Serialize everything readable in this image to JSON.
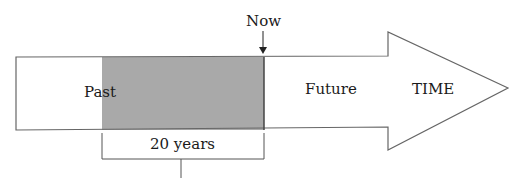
{
  "diagram": {
    "labels": {
      "now": "Now",
      "past": "Past",
      "future": "Future",
      "time": "TIME",
      "span": "20 years"
    },
    "colors": {
      "shaded_region": "#a9a9a9",
      "outline": "#555555",
      "background": "#ffffff"
    }
  }
}
